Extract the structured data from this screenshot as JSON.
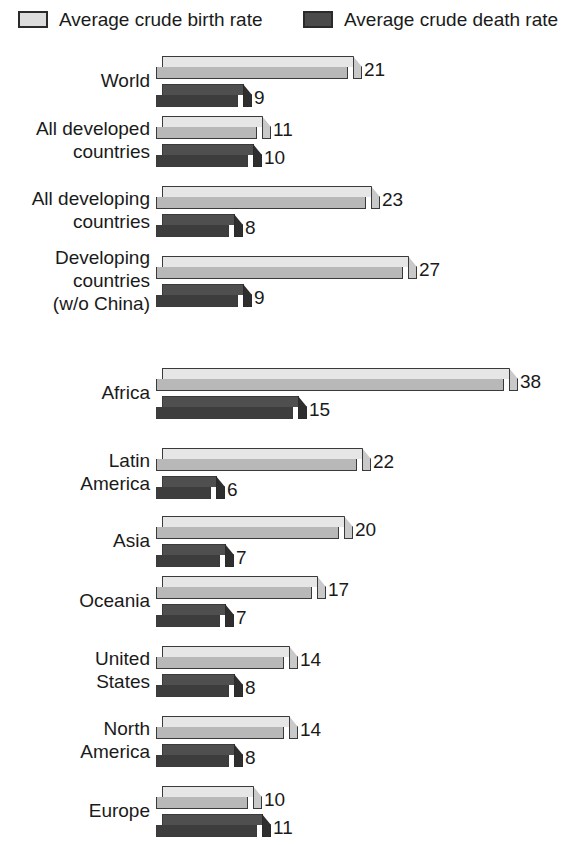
{
  "legend": {
    "entries": [
      {
        "label": "Average crude birth rate",
        "swatch": "light",
        "color": "#dcdcdc"
      },
      {
        "label": "Average crude death rate",
        "swatch": "dark",
        "color": "#4a4a4a"
      }
    ]
  },
  "chart_data": {
    "type": "bar",
    "orientation": "horizontal",
    "title": "",
    "subtitle": "",
    "xlabel": "",
    "ylabel": "",
    "xlim": [
      0,
      40
    ],
    "grid": false,
    "legend_position": "top",
    "value_labels": true,
    "series": [
      {
        "name": "Average crude birth rate",
        "color": "#dcdcdc",
        "values": [
          21,
          11,
          23,
          27,
          38,
          22,
          20,
          17,
          14,
          14,
          10
        ]
      },
      {
        "name": "Average crude death rate",
        "color": "#4a4a4a",
        "values": [
          9,
          10,
          8,
          9,
          15,
          6,
          7,
          7,
          8,
          8,
          11
        ]
      }
    ],
    "categories": [
      "World",
      "All developed\ncountries",
      "All developing\ncountries",
      "Developing\ncountries\n(w/o China)",
      "Africa",
      "Latin\nAmerica",
      "Asia",
      "Oceania",
      "United\nStates",
      "North\nAmerica",
      "Europe"
    ],
    "groups": [
      {
        "section": 1,
        "category": "World",
        "category_lines": [
          "World"
        ],
        "birth": 21,
        "death": 9,
        "birth_label": "21",
        "death_label": "9"
      },
      {
        "section": 1,
        "category": "All developed countries",
        "category_lines": [
          "All developed",
          "countries"
        ],
        "birth": 11,
        "death": 10,
        "birth_label": "11",
        "death_label": "10"
      },
      {
        "section": 1,
        "category": "All developing countries",
        "category_lines": [
          "All developing",
          "countries"
        ],
        "birth": 23,
        "death": 8,
        "birth_label": "23",
        "death_label": "8"
      },
      {
        "section": 1,
        "category": "Developing countries (w/o China)",
        "category_lines": [
          "Developing",
          "countries",
          "(w/o China)"
        ],
        "birth": 27,
        "death": 9,
        "birth_label": "27",
        "death_label": "9"
      },
      {
        "section": 2,
        "category": "Africa",
        "category_lines": [
          "Africa"
        ],
        "birth": 38,
        "death": 15,
        "birth_label": "38",
        "death_label": "15"
      },
      {
        "section": 2,
        "category": "Latin America",
        "category_lines": [
          "Latin",
          "America"
        ],
        "birth": 22,
        "death": 6,
        "birth_label": "22",
        "death_label": "6"
      },
      {
        "section": 2,
        "category": "Asia",
        "category_lines": [
          "Asia"
        ],
        "birth": 20,
        "death": 7,
        "birth_label": "20",
        "death_label": "7"
      },
      {
        "section": 2,
        "category": "Oceania",
        "category_lines": [
          "Oceania"
        ],
        "birth": 17,
        "death": 7,
        "birth_label": "17",
        "death_label": "7"
      },
      {
        "section": 2,
        "category": "United States",
        "category_lines": [
          "United",
          "States"
        ],
        "birth": 14,
        "death": 8,
        "birth_label": "14",
        "death_label": "8"
      },
      {
        "section": 2,
        "category": "North America",
        "category_lines": [
          "North",
          "America"
        ],
        "birth": 14,
        "death": 8,
        "birth_label": "14",
        "death_label": "8"
      },
      {
        "section": 2,
        "category": "Europe",
        "category_lines": [
          "Europe"
        ],
        "birth": 10,
        "death": 11,
        "birth_label": "10",
        "death_label": "11"
      }
    ]
  },
  "layout": {
    "bar_origin_x": 162,
    "px_per_unit": 9.15,
    "group_tops": [
      8,
      68,
      138,
      208,
      320,
      400,
      468,
      528,
      598,
      668,
      738
    ],
    "birth_offset": 0,
    "death_offset": 28
  }
}
